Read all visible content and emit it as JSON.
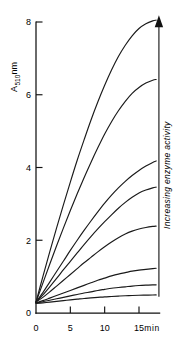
{
  "figure": {
    "name": "enzyme-activity-progress-curves",
    "background_color": "#ffffff",
    "ink_color": "#111111"
  },
  "chart_data": {
    "type": "line",
    "title": "",
    "xlabel": "min",
    "ylabel": "A510nm",
    "ylabel_base": "A",
    "ylabel_subscript": "510",
    "ylabel_unit": "nm",
    "xlim": [
      0,
      18.6
    ],
    "ylim": [
      0,
      8.6
    ],
    "x_ticks": [
      0,
      5,
      10,
      15
    ],
    "x_tick_labels": [
      "0",
      "5",
      "10",
      "15"
    ],
    "y_ticks": [
      0,
      2,
      4,
      6,
      8
    ],
    "y_tick_labels": [
      "0",
      "2",
      "4",
      "6",
      "8"
    ],
    "grid": false,
    "legend": "none",
    "x_unit_label": "min",
    "series_count": 8,
    "x": [
      0,
      1,
      2,
      3,
      4,
      5,
      6,
      7,
      8,
      9,
      10,
      11,
      12,
      13,
      14,
      15,
      16,
      17,
      17.5
    ],
    "series": [
      {
        "name": "curve-1-highest-activity",
        "values": [
          0.3,
          1.0,
          1.68,
          2.34,
          2.98,
          3.6,
          4.2,
          4.76,
          5.3,
          5.8,
          6.26,
          6.68,
          7.05,
          7.36,
          7.62,
          7.82,
          7.95,
          8.03,
          8.05
        ]
      },
      {
        "name": "curve-2",
        "values": [
          0.3,
          0.82,
          1.34,
          1.85,
          2.34,
          2.82,
          3.28,
          3.72,
          4.14,
          4.54,
          4.92,
          5.26,
          5.56,
          5.82,
          6.04,
          6.2,
          6.32,
          6.4,
          6.42
        ]
      },
      {
        "name": "curve-3",
        "values": [
          0.3,
          0.56,
          0.85,
          1.14,
          1.43,
          1.72,
          2.0,
          2.27,
          2.53,
          2.78,
          3.02,
          3.24,
          3.44,
          3.62,
          3.78,
          3.92,
          4.04,
          4.14,
          4.18
        ]
      },
      {
        "name": "curve-4",
        "values": [
          0.3,
          0.5,
          0.72,
          0.95,
          1.19,
          1.42,
          1.65,
          1.88,
          2.1,
          2.31,
          2.51,
          2.7,
          2.88,
          3.04,
          3.18,
          3.3,
          3.38,
          3.44,
          3.46
        ]
      },
      {
        "name": "curve-5",
        "values": [
          0.3,
          0.43,
          0.58,
          0.74,
          0.9,
          1.06,
          1.22,
          1.38,
          1.53,
          1.68,
          1.82,
          1.95,
          2.07,
          2.17,
          2.25,
          2.31,
          2.35,
          2.38,
          2.39
        ]
      },
      {
        "name": "curve-6",
        "values": [
          0.28,
          0.34,
          0.41,
          0.48,
          0.55,
          0.62,
          0.69,
          0.76,
          0.83,
          0.9,
          0.96,
          1.02,
          1.07,
          1.11,
          1.15,
          1.18,
          1.2,
          1.22,
          1.23
        ]
      },
      {
        "name": "curve-7",
        "values": [
          0.28,
          0.31,
          0.35,
          0.39,
          0.43,
          0.47,
          0.51,
          0.55,
          0.58,
          0.62,
          0.65,
          0.68,
          0.7,
          0.72,
          0.74,
          0.755,
          0.765,
          0.772,
          0.775
        ]
      },
      {
        "name": "curve-8-lowest-activity",
        "values": [
          0.26,
          0.28,
          0.3,
          0.32,
          0.34,
          0.36,
          0.38,
          0.4,
          0.415,
          0.43,
          0.445,
          0.455,
          0.465,
          0.475,
          0.482,
          0.488,
          0.492,
          0.495,
          0.497
        ]
      }
    ],
    "annotations": [
      {
        "name": "increasing-enzyme-activity-arrow",
        "text": "Increasing enzyme activity",
        "orientation": "vertical-up",
        "x_data": 17.9,
        "y_from": 0.45,
        "y_to": 7.9
      }
    ]
  }
}
